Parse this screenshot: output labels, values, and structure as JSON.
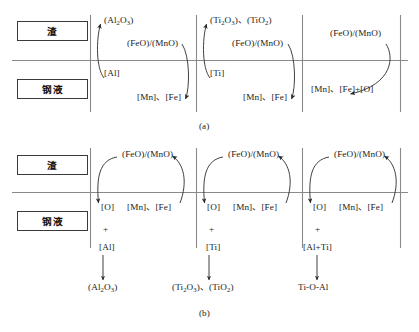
{
  "figure": {
    "phase_labels": {
      "slag": "渣",
      "steel": "钢液"
    },
    "panels": [
      {
        "caption": "(a)",
        "cells": [
          {
            "slag_species": "(Al2O3)",
            "slag_oxide": "(FeO)/(MnO)",
            "metal_reductant": "[Al]",
            "metal_products": "[Mn]、[Fe]"
          },
          {
            "slag_species": "(Ti2O3)、(TiO2)",
            "slag_oxide": "(FeO)/(MnO)",
            "metal_reductant": "[Ti]",
            "metal_products": "[Mn]、[Fe]"
          },
          {
            "slag_species": "",
            "slag_oxide": "(FeO)/(MnO)",
            "metal_reductant": "",
            "metal_products": "[Mn]、[Fe]+[O]"
          }
        ]
      },
      {
        "caption": "(b)",
        "cells": [
          {
            "slag_oxide": "(FeO)/(MnO)",
            "oxygen": "[O]",
            "plus": "+",
            "metal_products": "[Mn]、[Fe]",
            "reductant": "[Al]",
            "product": "(Al2O3)"
          },
          {
            "slag_oxide": "(FeO)/(MnO)",
            "oxygen": "[O]",
            "plus": "+",
            "metal_products": "[Mn]、[Fe]",
            "reductant": "[Ti]",
            "product": "(Ti2O3)、(TiO2)"
          },
          {
            "slag_oxide": "(FeO)/(MnO)",
            "oxygen": "[O]",
            "plus": "+",
            "metal_products": "[Mn]、[Fe]",
            "reductant": "[Al+Ti]",
            "product": "Ti-O-Al"
          }
        ]
      }
    ],
    "colors": {
      "line": "#8a8a8a",
      "arrow": "#2b2b2b",
      "box_border": "#3a3a3a",
      "text": "#1a1a1a"
    }
  }
}
